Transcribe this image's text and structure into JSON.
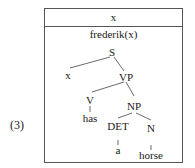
{
  "example_label": "(3)",
  "drs": {
    "universe": "x",
    "condition": "frederik(x)"
  },
  "tree": {
    "S": "S",
    "x": "x",
    "VP": "VP",
    "V": "V",
    "has": "has",
    "NP": "NP",
    "DET": "DET",
    "a": "a",
    "N": "N",
    "horse": "horse"
  }
}
